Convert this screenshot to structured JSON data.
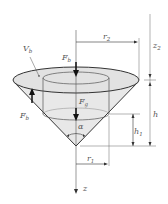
{
  "diagram": {
    "labels": {
      "V_b": {
        "main": "V",
        "sub": "b"
      },
      "F_b_top": {
        "main": "F",
        "sub": "b"
      },
      "F_g": {
        "main": "F",
        "sub": "g"
      },
      "F_b_left": {
        "main": "F",
        "sub": "b"
      },
      "alpha": "α",
      "r2": {
        "main": "r",
        "sub": "2"
      },
      "r1": {
        "main": "r",
        "sub": "1"
      },
      "z2": {
        "main": "z",
        "sub": "2"
      },
      "h": "h",
      "h1": {
        "main": "h",
        "sub": "1"
      },
      "z": "z"
    },
    "colors": {
      "line": "#333333",
      "fill": "#e6e6e6",
      "dim": "#666666"
    }
  }
}
